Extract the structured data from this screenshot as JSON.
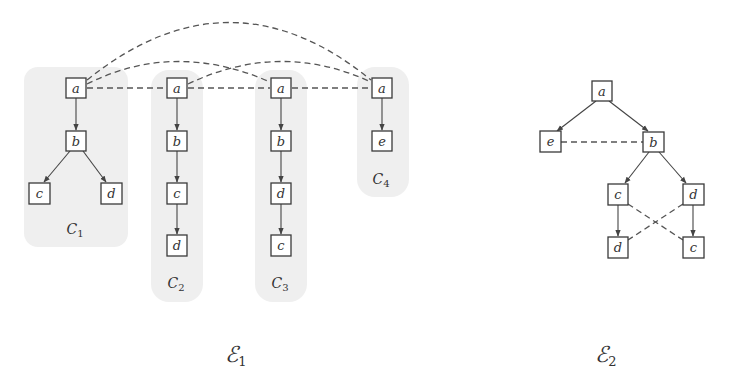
{
  "ensembles": [
    {
      "id": "E1",
      "label": "ℰ",
      "subscript": "1",
      "components": [
        {
          "id": "C1",
          "label": "C",
          "subscript": "1",
          "nodes": [
            "a",
            "b",
            "c",
            "d"
          ],
          "edges": [
            [
              "a",
              "b"
            ],
            [
              "b",
              "c"
            ],
            [
              "b",
              "d"
            ]
          ]
        },
        {
          "id": "C2",
          "label": "C",
          "subscript": "2",
          "nodes": [
            "a",
            "b",
            "c",
            "d"
          ],
          "edges": [
            [
              "a",
              "b"
            ],
            [
              "b",
              "c"
            ],
            [
              "c",
              "d"
            ]
          ]
        },
        {
          "id": "C3",
          "label": "C",
          "subscript": "3",
          "nodes": [
            "a",
            "b",
            "d",
            "c"
          ],
          "edges": [
            [
              "a",
              "b"
            ],
            [
              "b",
              "d"
            ],
            [
              "d",
              "c"
            ]
          ]
        },
        {
          "id": "C4",
          "label": "C",
          "subscript": "4",
          "nodes": [
            "a",
            "e"
          ],
          "edges": [
            [
              "a",
              "e"
            ]
          ]
        }
      ],
      "dashed_links": [
        [
          "C1.a",
          "C2.a"
        ],
        [
          "C2.a",
          "C3.a"
        ],
        [
          "C3.a",
          "C4.a"
        ],
        [
          "C1.a",
          "C3.a"
        ],
        [
          "C2.a",
          "C4.a"
        ],
        [
          "C1.a",
          "C4.a"
        ]
      ]
    },
    {
      "id": "E2",
      "label": "ℰ",
      "subscript": "2",
      "nodes": [
        "a",
        "e",
        "b",
        "c",
        "d",
        "d",
        "c"
      ],
      "edges": [
        [
          "a",
          "e"
        ],
        [
          "a",
          "b"
        ],
        [
          "b",
          "c"
        ],
        [
          "b",
          "d"
        ],
        [
          "c",
          "d"
        ],
        [
          "d",
          "c"
        ]
      ],
      "dashed_links": [
        [
          "e",
          "b"
        ],
        [
          "c",
          "c"
        ],
        [
          "d",
          "d"
        ]
      ]
    }
  ],
  "labels": {
    "c1_a": "a",
    "c1_b": "b",
    "c1_c": "c",
    "c1_d": "d",
    "c2_a": "a",
    "c2_b": "b",
    "c2_c": "c",
    "c2_d": "d",
    "c3_a": "a",
    "c3_b": "b",
    "c3_d": "d",
    "c3_c": "c",
    "c4_a": "a",
    "c4_e": "e",
    "e2_a": "a",
    "e2_e": "e",
    "e2_b": "b",
    "e2_c": "c",
    "e2_d": "d",
    "e2_d2": "d",
    "e2_c2": "c",
    "comp_C": "C",
    "sub1": "1",
    "sub2": "2",
    "sub3": "3",
    "sub4": "4",
    "ens_E": "ℰ"
  }
}
